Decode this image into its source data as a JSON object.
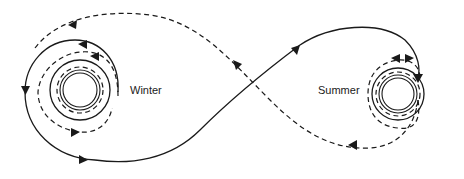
{
  "diagram": {
    "type": "figure-eight circulation diagram",
    "labels": {
      "left": "Winter",
      "right": "Summer"
    },
    "legend_hint": {
      "solid_line": "one flow path",
      "dashed_line": "opposite flow path"
    },
    "colors": {
      "ink": "#1a1a1a",
      "background": "#ffffff"
    }
  }
}
